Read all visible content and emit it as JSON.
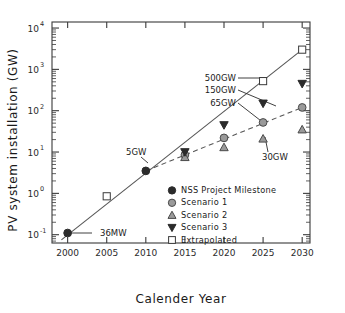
{
  "chart_data": {
    "type": "scatter",
    "title": "",
    "xlabel": "Calender Year",
    "ylabel": "PV system installation (GW)",
    "xlim": [
      1998,
      2031
    ],
    "ylim": [
      0.063,
      14000
    ],
    "yscale": "log",
    "grid": false,
    "legend_position": "inside-lower-right",
    "xticks": [
      "2000",
      "2005",
      "2010",
      "2015",
      "2020",
      "2025",
      "2030"
    ],
    "xtick_values": [
      2000,
      2005,
      2010,
      2015,
      2020,
      2025,
      2030
    ],
    "yticks": [
      "10-1",
      "100",
      "101",
      "102",
      "103",
      "104"
    ],
    "ytick_mantissa": [
      "10",
      "10",
      "10",
      "10",
      "10",
      "10"
    ],
    "ytick_exponents": [
      "-1",
      "0",
      "1",
      "2",
      "3",
      "4"
    ],
    "ytick_values": [
      0.1,
      1,
      10,
      100,
      1000,
      10000
    ],
    "series": [
      {
        "name": "NSS Project Milestone",
        "marker": "filled-circle",
        "color": "#2b2b2b",
        "x": [
          2000,
          2010
        ],
        "values": [
          0.11,
          3.5
        ]
      },
      {
        "name": "Scenario 1",
        "marker": "gray-circle",
        "color": "#9a9a9a",
        "x": [
          2015,
          2020,
          2025,
          2030
        ],
        "values": [
          8.5,
          22,
          52,
          120
        ]
      },
      {
        "name": "Scenario 2",
        "marker": "triangle-up",
        "color": "#9a9a9a",
        "x": [
          2015,
          2020,
          2025,
          2030
        ],
        "values": [
          7.5,
          13,
          21,
          35
        ]
      },
      {
        "name": "Scenario 3",
        "marker": "triangle-down",
        "color": "#3a3a3a",
        "x": [
          2015,
          2020,
          2025,
          2030
        ],
        "values": [
          10,
          45,
          150,
          450
        ]
      },
      {
        "name": "Extrapolated",
        "marker": "open-square",
        "color": "#ffffff",
        "x": [
          2005,
          2025,
          2030
        ],
        "values": [
          0.85,
          520,
          3000
        ]
      }
    ],
    "trend_solid": {
      "name": "extrapolation-trend",
      "x": [
        1999.2,
        2030
      ],
      "values": [
        0.075,
        3000
      ]
    },
    "trend_dashed": {
      "name": "scenario1-trend",
      "x": [
        2010,
        2030
      ],
      "values": [
        3.5,
        120
      ]
    },
    "annotations": [
      {
        "id": "a36mw",
        "text": "36MW",
        "target_x": 2000,
        "target_y": 0.11
      },
      {
        "id": "a5gw",
        "text": "5GW",
        "target_x": 2010,
        "target_y": 3.5
      },
      {
        "id": "a500gw",
        "text": "500GW",
        "target_x": 2025,
        "target_y": 520
      },
      {
        "id": "a150gw",
        "text": "150GW",
        "target_x": 2025,
        "target_y": 150
      },
      {
        "id": "a65gw",
        "text": "65GW",
        "target_x": 2025,
        "target_y": 52
      },
      {
        "id": "a30gw",
        "text": "30GW",
        "target_x": 2025,
        "target_y": 21
      }
    ],
    "legend": [
      {
        "label": "NSS Project Milestone",
        "marker": "filled-circle"
      },
      {
        "label": "Scenario 1",
        "marker": "gray-circle"
      },
      {
        "label": "Scenario 2",
        "marker": "triangle-up"
      },
      {
        "label": "Scenario 3",
        "marker": "triangle-down"
      },
      {
        "label": "Extrapolated",
        "marker": "open-square"
      }
    ],
    "colors": {
      "axis": "#3a3a3a",
      "text": "#1a1a1a",
      "line": "#555555",
      "marker_dark": "#2b2b2b",
      "marker_gray": "#9a9a9a",
      "marker_open": "#ffffff"
    }
  }
}
